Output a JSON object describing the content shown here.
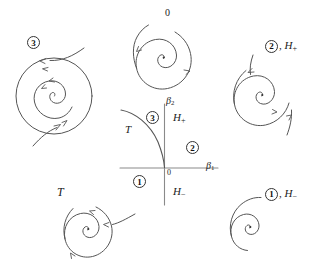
{
  "figure": {
    "kind": "bifurcation-diagram",
    "width": 323,
    "height": 269,
    "background": "#ffffff",
    "stroke_color": "#555555",
    "text_color": "#1a1a1a"
  },
  "parameter_plane": {
    "name": "central-parameter-plane",
    "axis_x_label": "β",
    "axis_x_sub": "1",
    "axis_y_label": "β",
    "axis_y_sub": "2",
    "origin_label": "0",
    "curve_label": "T",
    "region_upper_label": "H",
    "region_upper_sign": "+",
    "region_lower_label": "H",
    "region_lower_sign": "−",
    "region_1": "1",
    "region_2": "2",
    "region_3": "3"
  },
  "portraits": [
    {
      "id": "portrait-top-left",
      "label": "3",
      "label_kind": "circled-number",
      "description": "unstable-focus-with-limit-cycle"
    },
    {
      "id": "portrait-top-center",
      "label": "0",
      "label_kind": "plain",
      "description": "stable-focus-spiral-inward"
    },
    {
      "id": "portrait-top-right",
      "label": "2",
      "label_kind": "circled-number",
      "suffix": ", H",
      "suffix_sign": "+",
      "description": "unstable-focus-spiral-outward"
    },
    {
      "id": "portrait-bottom-left",
      "label": "T",
      "label_kind": "italic",
      "description": "semi-stable-cycle-saddle-node-of-cycles"
    },
    {
      "id": "portrait-bottom-right",
      "label": "1",
      "label_kind": "circled-number",
      "suffix": ", H",
      "suffix_sign": "−",
      "description": "stable-focus-spiral-inward"
    }
  ]
}
